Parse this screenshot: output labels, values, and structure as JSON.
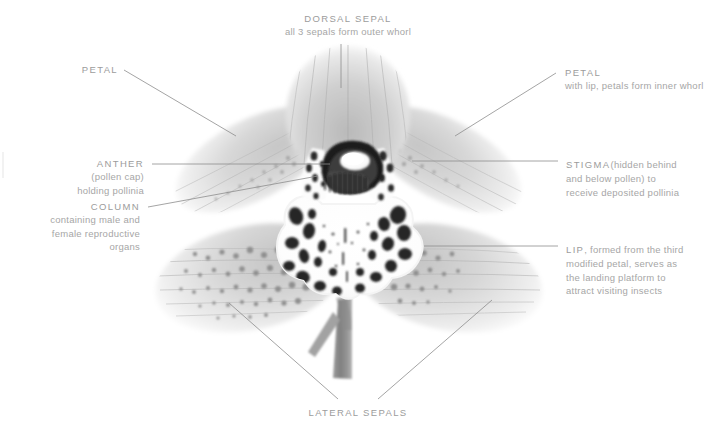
{
  "figure": {
    "style": "grayscale x-ray botanical photograph",
    "background_color": "#ffffff",
    "text_color": "#9c9c9c",
    "leader_line_color": "#8d8d8d"
  },
  "labels": {
    "dorsal_sepal": {
      "heading": "DORSAL SEPAL",
      "description": "all 3 sepals form outer whorl"
    },
    "petal_left": {
      "heading": "PETAL",
      "description": ""
    },
    "petal_right": {
      "heading": "PETAL",
      "description": "with lip, petals form inner whorl"
    },
    "anther": {
      "heading": "ANTHER",
      "line2": "(pollen cap)",
      "line3": "holding pollinia"
    },
    "column": {
      "heading": "COLUMN",
      "line2": "containing male and",
      "line3": "female reproductive",
      "line4": "organs"
    },
    "stigma": {
      "heading": "STIGMA",
      "line1_rest": "(hidden behind",
      "line2": "and below pollen) to",
      "line3": "receive deposited pollinia"
    },
    "lip": {
      "heading": "LIP",
      "line1_rest": ", formed from the third",
      "line2": "modified petal, serves as",
      "line3": "the landing platform to",
      "line4": "attract visiting insects"
    },
    "lateral_sepals": {
      "heading": "LATERAL SEPALS"
    }
  },
  "flower_parts": [
    {
      "name": "dorsal-sepal",
      "role": "upper sepal, outer whorl"
    },
    {
      "name": "petal-left",
      "role": "inner whorl petal"
    },
    {
      "name": "petal-right",
      "role": "inner whorl petal"
    },
    {
      "name": "lateral-sepal-left",
      "role": "outer whorl sepal"
    },
    {
      "name": "lateral-sepal-right",
      "role": "outer whorl sepal"
    },
    {
      "name": "lip",
      "role": "modified third petal / landing platform"
    },
    {
      "name": "column",
      "role": "fused reproductive organs"
    },
    {
      "name": "anther",
      "role": "pollen cap holding pollinia"
    },
    {
      "name": "stigma",
      "role": "receives deposited pollinia"
    },
    {
      "name": "stem",
      "role": "pedicel"
    }
  ]
}
